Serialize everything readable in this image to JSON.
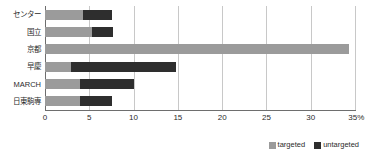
{
  "chart_data": {
    "type": "bar",
    "orientation": "horizontal",
    "stacked": true,
    "title": "",
    "xlabel": "",
    "ylabel": "",
    "xlim": [
      0,
      35
    ],
    "xticks": [
      0,
      5,
      10,
      15,
      20,
      25,
      30,
      35
    ],
    "xtick_labels": [
      "0",
      "5",
      "10",
      "15",
      "20",
      "25",
      "30",
      "35%"
    ],
    "grid": true,
    "grid_axis": "x",
    "legend_position": "bottom-right",
    "categories": [
      "センター",
      "国立",
      "京都",
      "早慶",
      "MARCH",
      "日東駒専"
    ],
    "series": [
      {
        "name": "targeted",
        "color": "#9b9b9b",
        "values": [
          4.3,
          5.3,
          34.3,
          2.9,
          3.9,
          3.9
        ]
      },
      {
        "name": "untargeted",
        "color": "#2e2e2e",
        "values": [
          3.3,
          2.4,
          0,
          11.9,
          6.1,
          3.7
        ]
      }
    ],
    "totals": [
      7.6,
      7.7,
      34.3,
      14.8,
      10.0,
      7.6
    ]
  },
  "legend": {
    "items": [
      {
        "label": "targeted",
        "color": "#9b9b9b"
      },
      {
        "label": "untargeted",
        "color": "#2e2e2e"
      }
    ]
  },
  "colors": {
    "targeted": "#9b9b9b",
    "untargeted": "#2e2e2e",
    "gridline": "#c8c8c8",
    "axis": "#6e6e6e",
    "text": "#2b2b2b",
    "background": "#ffffff"
  }
}
